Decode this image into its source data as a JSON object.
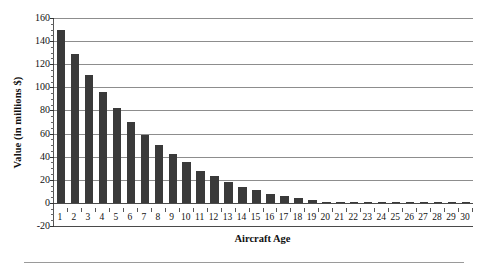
{
  "chart_data": {
    "type": "bar",
    "title": "",
    "xlabel": "Aircraft Age",
    "ylabel": "Value (in millions $)",
    "categories": [
      "1",
      "2",
      "3",
      "4",
      "5",
      "6",
      "7",
      "8",
      "9",
      "10",
      "11",
      "12",
      "13",
      "14",
      "15",
      "16",
      "17",
      "18",
      "19",
      "20",
      "21",
      "22",
      "23",
      "24",
      "25",
      "26",
      "27",
      "28",
      "29",
      "30"
    ],
    "values": [
      150,
      129,
      111,
      96,
      82,
      70,
      59,
      50,
      42,
      35,
      28,
      23,
      18,
      14,
      11,
      8,
      6,
      4,
      2.5,
      1,
      0.6,
      0.3,
      0.3,
      0.3,
      0.3,
      0.3,
      0.3,
      0.3,
      0.3,
      0.3
    ],
    "ylim": [
      -20,
      160
    ],
    "ytick_values": [
      160,
      140,
      120,
      100,
      80,
      60,
      40,
      20,
      0,
      -20
    ],
    "ytick_labels": [
      "160",
      "140",
      "120",
      "100",
      "80",
      "60",
      "40",
      "20",
      "0",
      "-20"
    ],
    "ytick_step": 20,
    "yminor_step": 5,
    "grid": true,
    "grid_axis": "y",
    "legend": false,
    "legend_position": "none",
    "bar_color": "#3a3a3a",
    "gridline_color": "#8d8d8d",
    "axis_color": "#4a4a4a",
    "text_color": "#111111",
    "background_color": "#ffffff"
  },
  "figure": {
    "bottom_rule_visible": true
  }
}
